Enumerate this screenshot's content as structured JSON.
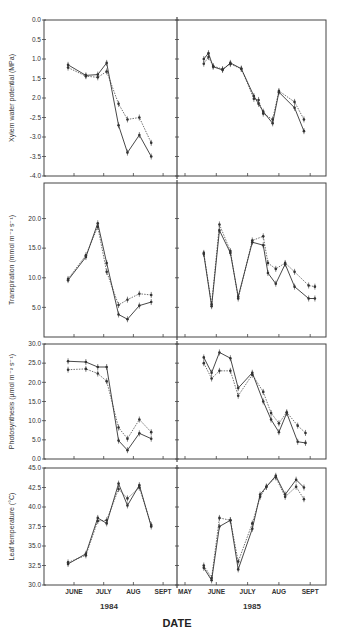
{
  "chart_data": {
    "type": "line",
    "xlabel": "DATE",
    "years": [
      "1984",
      "1985"
    ],
    "month_ticks": {
      "1984": [
        "JUNE",
        "JULY",
        "AUG",
        "SEPT"
      ],
      "1985": [
        "MAY",
        "JUNE",
        "JULY",
        "AUG",
        "SEPT"
      ]
    },
    "series_styles": [
      {
        "name": "solid",
        "dash": false
      },
      {
        "name": "dashed",
        "dash": true
      }
    ],
    "panels": [
      {
        "id": "xylem",
        "ylabel": "Xylem water potential (MPa)",
        "ylim": [
          0.0,
          -4.0
        ],
        "yticks": [
          "0.0",
          "0.5",
          "1.0",
          "1.5",
          "2.0",
          "-2.5",
          "-3.0",
          "-3.5",
          "-4.0"
        ],
        "yvalues": [
          0,
          -0.5,
          -1.0,
          -1.5,
          -2.0,
          -2.5,
          -3.0,
          -3.5,
          -4.0
        ],
        "1984": {
          "x": [
            5.8,
            6.4,
            6.8,
            7.1,
            7.5,
            7.8,
            8.2,
            8.6
          ],
          "solid": [
            -1.15,
            -1.42,
            -1.4,
            -1.1,
            -2.7,
            -3.4,
            -2.95,
            -3.5
          ],
          "dashed": [
            -1.22,
            -1.44,
            -1.47,
            -1.32,
            -2.15,
            -2.55,
            -2.5,
            -3.15
          ]
        },
        "1985": {
          "x": [
            5.6,
            5.75,
            5.9,
            6.2,
            6.45,
            6.8,
            7.2,
            7.35,
            7.5,
            7.8,
            8.0,
            8.5,
            8.8,
            8.95
          ],
          "solid": [
            -1.0,
            -0.85,
            -1.2,
            -1.28,
            -1.1,
            -1.25,
            -1.95,
            -2.15,
            -2.35,
            -2.65,
            -1.85,
            -2.25,
            -2.85,
            null
          ],
          "dashed": [
            -1.12,
            -0.95,
            -1.18,
            -1.26,
            -1.13,
            -1.25,
            -2.02,
            -2.05,
            -2.4,
            -2.55,
            -1.82,
            -2.1,
            -2.55,
            null
          ]
        }
      },
      {
        "id": "transpiration",
        "ylabel": "Transpiration (mmol m⁻² s⁻¹)",
        "ylim": [
          0.0,
          26.0
        ],
        "yticks": [
          "5.0",
          "10.0",
          "15.0",
          "20.0"
        ],
        "yvalues": [
          5,
          10,
          15,
          20
        ],
        "1984": {
          "x": [
            5.8,
            6.4,
            6.8,
            7.1,
            7.5,
            7.8,
            8.2,
            8.6
          ],
          "solid": [
            9.6,
            13.5,
            19.2,
            12.5,
            3.8,
            3.0,
            5.3,
            5.9
          ],
          "dashed": [
            9.8,
            13.8,
            18.6,
            11.0,
            5.4,
            6.3,
            7.3,
            7.1
          ]
        },
        "1985": {
          "x": [
            5.6,
            5.85,
            6.1,
            6.45,
            6.7,
            7.15,
            7.5,
            7.65,
            7.9,
            8.2,
            8.5,
            8.95,
            9.15
          ],
          "solid": [
            14.0,
            5.2,
            18.0,
            14.2,
            6.8,
            16.0,
            15.5,
            10.8,
            9.0,
            12.3,
            8.5,
            6.5,
            6.5
          ],
          "dashed": [
            14.2,
            5.5,
            19.0,
            14.5,
            6.5,
            16.3,
            17.0,
            12.5,
            11.5,
            12.5,
            11.0,
            8.7,
            8.5
          ]
        }
      },
      {
        "id": "photosynthesis",
        "ylabel": "Photosynthesis (µmol m⁻² s⁻¹)",
        "ylim": [
          0.0,
          30.0
        ],
        "yticks": [
          "0.0",
          "5.0",
          "10.0",
          "15.0",
          "20.0",
          "25.0",
          "30.0"
        ],
        "yvalues": [
          0,
          5,
          10,
          15,
          20,
          25,
          30
        ],
        "1984": {
          "x": [
            5.8,
            6.4,
            6.8,
            7.1,
            7.5,
            7.8,
            8.2,
            8.6
          ],
          "solid": [
            25.5,
            25.3,
            24.0,
            24.0,
            4.8,
            2.3,
            6.7,
            5.3
          ],
          "dashed": [
            23.3,
            23.5,
            22.3,
            20.3,
            8.2,
            5.3,
            10.3,
            7.0
          ]
        },
        "1985": {
          "x": [
            5.6,
            5.85,
            6.1,
            6.45,
            6.7,
            7.15,
            7.5,
            7.75,
            8.0,
            8.25,
            8.6,
            8.85
          ],
          "solid": [
            26.5,
            22.5,
            27.8,
            26.3,
            18.5,
            22.5,
            15.0,
            10.3,
            7.0,
            12.0,
            4.5,
            4.2
          ],
          "dashed": [
            25.0,
            21.0,
            23.0,
            23.0,
            16.5,
            22.0,
            17.5,
            12.0,
            9.3,
            12.2,
            8.7,
            6.8
          ]
        }
      },
      {
        "id": "leaf_temperature",
        "ylabel": "Leaf temperature (°C)",
        "ylim": [
          30.0,
          45.0
        ],
        "yticks": [
          "30.0",
          "32.5",
          "35.0",
          "37.5",
          "40.0",
          "42.5",
          "45.0"
        ],
        "yvalues": [
          30,
          32.5,
          35,
          37.5,
          40,
          42.5,
          45
        ],
        "1984": {
          "x": [
            5.8,
            6.4,
            6.8,
            7.1,
            7.5,
            7.8,
            8.2,
            8.6
          ],
          "solid": [
            32.7,
            34.0,
            38.6,
            37.9,
            43.0,
            40.2,
            42.8,
            37.5
          ],
          "dashed": [
            32.9,
            33.8,
            38.2,
            38.3,
            42.3,
            41.1,
            42.5,
            37.7
          ]
        },
        "1985": {
          "x": [
            5.6,
            5.85,
            6.1,
            6.45,
            6.7,
            7.15,
            7.4,
            7.6,
            7.9,
            8.2,
            8.55,
            8.8
          ],
          "solid": [
            32.2,
            30.6,
            37.5,
            38.3,
            32.0,
            37.2,
            41.6,
            42.6,
            44.0,
            41.6,
            43.5,
            42.5
          ],
          "dashed": [
            32.5,
            30.9,
            38.6,
            38.3,
            33.0,
            37.9,
            41.3,
            42.6,
            43.8,
            41.3,
            42.6,
            41.0
          ]
        }
      }
    ]
  },
  "colors": {
    "ink": "#333333",
    "frame": "#444444"
  }
}
